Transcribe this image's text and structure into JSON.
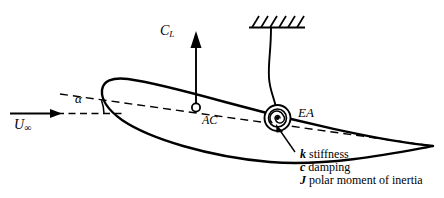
{
  "figure": {
    "stroke_color": "#000000",
    "background_color": "#ffffff"
  },
  "labels": {
    "lift_coefficient": {
      "symbol": "C",
      "subscript": "L",
      "text": "C_L"
    },
    "freestream_velocity": {
      "symbol": "U",
      "subscript": "∞",
      "text": "U_∞"
    },
    "angle_of_attack": {
      "symbol": "α",
      "text": "α"
    },
    "aerodynamic_center": {
      "text": "AC"
    },
    "elastic_axis": {
      "text": "EA"
    }
  },
  "annotations": [
    {
      "symbol": "k",
      "description": "stiffness"
    },
    {
      "symbol": "c",
      "description": "damping"
    },
    {
      "symbol": "J",
      "description": "polar moment of inertia"
    }
  ],
  "elements": {
    "ground_support": "fixed-ground-hatching",
    "support_rod": "flexible-support-rod",
    "torsional_spring": "spiral-spring-symbol",
    "airfoil": "airfoil-section-outline",
    "chord_line": "dashed-chord-line",
    "freestream_line": "dashed-horizontal-reference-line",
    "lift_arrow": "lift-force-arrow",
    "velocity_arrow": "freestream-velocity-arrow",
    "leader_line": "annotation-leader-line"
  }
}
